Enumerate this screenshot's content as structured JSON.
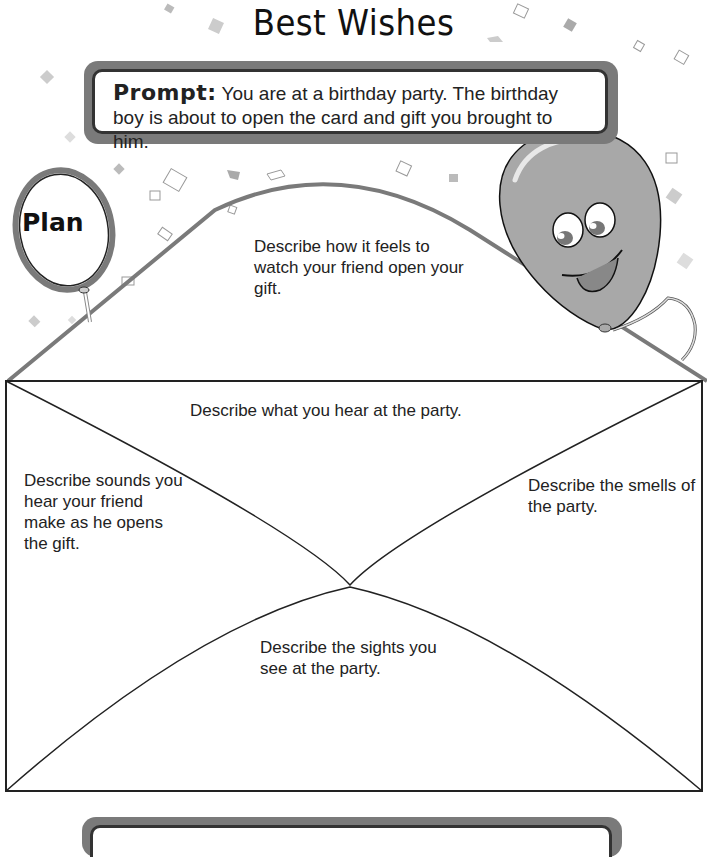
{
  "title": "Best Wishes",
  "prompt": {
    "label": "Prompt:",
    "text": " You are at a birthday party. The birthday boy is about to open the card and gift you brought to him."
  },
  "plan_balloon": {
    "label": "Plan"
  },
  "envelope": {
    "flap_top": "Describe how it feels to watch your friend open your gift.",
    "top": "Describe what you hear at the party.",
    "left": "Describe sounds you hear your friend make as he opens the gift.",
    "right": "Describe the smells of the party.",
    "bottom": "Describe the sights you see at the party."
  },
  "colors": {
    "frame_gray": "#7a7a7a",
    "balloon_gray": "#a8a8a8",
    "line_dark": "#222222"
  }
}
